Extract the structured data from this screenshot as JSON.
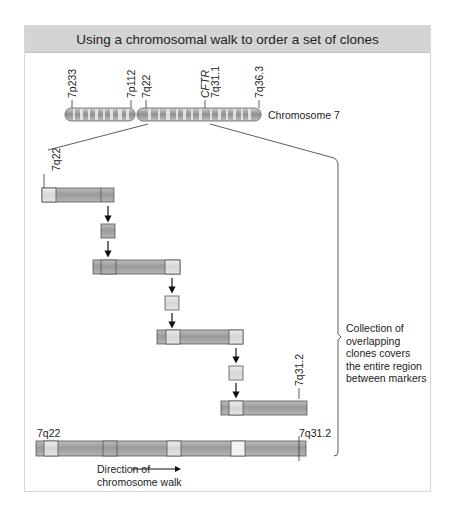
{
  "title": "Using a chromosomal walk to order a set of clones",
  "chromosome": {
    "label": "Chromosome 7",
    "markers": [
      {
        "id": "7p233",
        "label": "7p233",
        "x": 72
      },
      {
        "id": "7p112",
        "label": "7p112",
        "x": 131
      },
      {
        "id": "7q22",
        "label": "7q22",
        "x": 146
      },
      {
        "id": "cftr",
        "label": "CFTR",
        "x": 205,
        "italic": true
      },
      {
        "id": "7q311",
        "label": "7q31.1",
        "x": 214
      },
      {
        "id": "7q363",
        "label": "7q36.3",
        "x": 259
      }
    ]
  },
  "clone_labels": {
    "start_marker": "7q22",
    "end_marker": "7q31.2"
  },
  "contig": {
    "start_label": "7q22",
    "end_label": "7q31.2"
  },
  "annotation": {
    "lines": [
      "Collection of",
      "overlapping",
      "clones covers",
      "the entire region",
      "between markers"
    ]
  },
  "direction": {
    "line1": "Direction of",
    "line2": "chromosome walk"
  },
  "colors": {
    "title_bg": "#d4d4d4",
    "clone_fill": "#a9a9a9",
    "probe_fill": "#dcdcdc",
    "outline": "#555555"
  }
}
